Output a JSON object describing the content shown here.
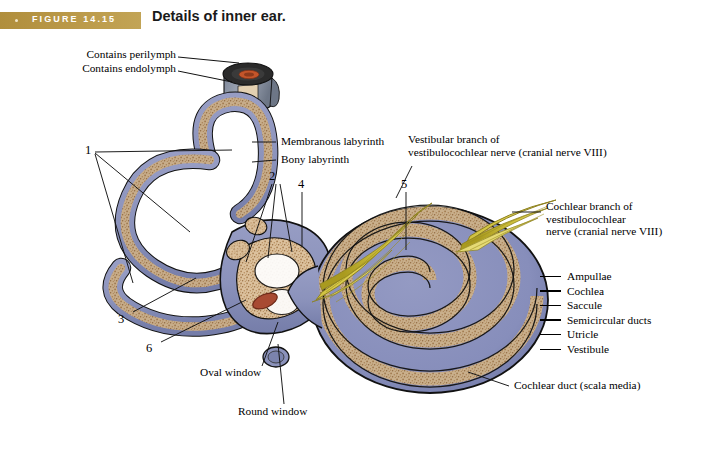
{
  "figure": {
    "banner_label": "FIGURE 14.15",
    "title": "Details of inner ear.",
    "banner_color": "#b89a46",
    "title_color": "#1a1a1a"
  },
  "callout_labels": [
    {
      "id": "contains-perilymph",
      "text": "Contains perilymph",
      "x": 75,
      "y": 52,
      "align": "right"
    },
    {
      "id": "contains-endolymph",
      "text": "Contains endolymph",
      "x": 70,
      "y": 66,
      "align": "right"
    },
    {
      "id": "membranous-labyrinth",
      "text": "Membranous labyrinth",
      "x": 280,
      "y": 138,
      "align": "left"
    },
    {
      "id": "bony-labyrinth",
      "text": "Bony labyrinth",
      "x": 280,
      "y": 156,
      "align": "left"
    },
    {
      "id": "oval-window",
      "text": "Oval window",
      "x": 200,
      "y": 372,
      "align": "left"
    },
    {
      "id": "round-window",
      "text": "Round window",
      "x": 237,
      "y": 412,
      "align": "left"
    },
    {
      "id": "cochlear-duct",
      "text": "Cochlear duct (scala media)",
      "x": 513,
      "y": 386,
      "align": "left"
    }
  ],
  "nerve_labels": [
    {
      "id": "vestibular-branch",
      "x": 408,
      "y": 136,
      "lines": [
        "Vestibular branch of",
        "vestibulocochlear nerve (cranial nerve VIII)"
      ]
    },
    {
      "id": "cochlear-branch",
      "x": 545,
      "y": 203,
      "lines": [
        "Cochlear branch of",
        "vestibulocochlear",
        "nerve (cranial nerve VIII)"
      ]
    }
  ],
  "number_callouts": [
    {
      "id": "1",
      "text": "1",
      "x": 85,
      "y": 145
    },
    {
      "id": "2",
      "text": "2",
      "x": 269,
      "y": 170
    },
    {
      "id": "3",
      "text": "3",
      "x": 119,
      "y": 313
    },
    {
      "id": "4",
      "text": "4",
      "x": 299,
      "y": 178
    },
    {
      "id": "5",
      "text": "5",
      "x": 402,
      "y": 178
    },
    {
      "id": "6",
      "text": "6",
      "x": 147,
      "y": 343
    }
  ],
  "answer_key": {
    "items": [
      "Ampullae",
      "Cochlea",
      "Saccule",
      "Semicircular ducts",
      "Utricle",
      "Vestibule"
    ]
  },
  "palette": {
    "bony_labyrinth": "#8b92bb",
    "bony_labyrinth_dark": "#6f77a4",
    "membranous_labyrinth": "#d9bd98",
    "membranous_stipple": "#a07a4e",
    "nerve_yellow": "#cfc043",
    "nerve_yellow_light": "#e6dd77",
    "nerve_yellow_dark": "#a89a22",
    "window_red": "#a84a32",
    "outline": "#111111",
    "cut_dark": "#2b2b2b",
    "cut_orange": "#c4552a",
    "cut_tan": "#e2cfb0",
    "cut_grey": "#8e98a8"
  }
}
